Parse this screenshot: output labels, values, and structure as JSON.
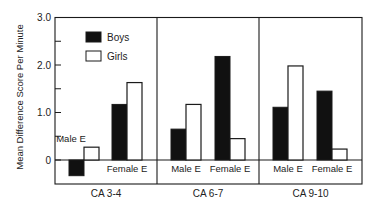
{
  "chart_data": {
    "type": "bar",
    "title": "",
    "xlabel": "",
    "ylabel": "Mean Difference Score Per Minute",
    "ylim": [
      -0.5,
      3.0
    ],
    "yticks": [
      {
        "value": 3.0,
        "label": "3.0"
      },
      {
        "value": 2.5,
        "label": ""
      },
      {
        "value": 2.0,
        "label": "2.0"
      },
      {
        "value": 1.5,
        "label": ""
      },
      {
        "value": 1.0,
        "label": "1.0"
      },
      {
        "value": 0.5,
        "label": ""
      },
      {
        "value": 0,
        "label": "0"
      }
    ],
    "grid": false,
    "legend": {
      "position": "upper-left (inside first panel)",
      "entries": [
        {
          "name": "Boys",
          "fill": "#111111"
        },
        {
          "name": "Girls",
          "fill": "#ffffff"
        }
      ]
    },
    "panels": [
      {
        "label": "CA 3-4",
        "groups": [
          {
            "label": "Male E",
            "label_position": "above",
            "boys": -0.33,
            "girls": 0.27
          },
          {
            "label": "Female E",
            "label_position": "below",
            "boys": 1.17,
            "girls": 1.63
          }
        ]
      },
      {
        "label": "CA 6-7",
        "groups": [
          {
            "label": "Male E",
            "label_position": "below",
            "boys": 0.65,
            "girls": 1.17
          },
          {
            "label": "Female E",
            "label_position": "below",
            "boys": 2.18,
            "girls": 0.45
          }
        ]
      },
      {
        "label": "CA 9-10",
        "groups": [
          {
            "label": "Male E",
            "label_position": "below",
            "boys": 1.11,
            "girls": 1.98
          },
          {
            "label": "Female E",
            "label_position": "below",
            "boys": 1.45,
            "girls": 0.23
          }
        ]
      }
    ],
    "categories": [
      "CA 3-4 Male E",
      "CA 3-4 Female E",
      "CA 6-7 Male E",
      "CA 6-7 Female E",
      "CA 9-10 Male E",
      "CA 9-10 Female E"
    ],
    "series": [
      {
        "name": "Boys",
        "values": [
          -0.33,
          1.17,
          0.65,
          2.18,
          1.11,
          1.45
        ]
      },
      {
        "name": "Girls",
        "values": [
          0.27,
          1.63,
          1.17,
          0.45,
          1.98,
          0.23
        ]
      }
    ]
  },
  "colors": {
    "boys": "#111111",
    "girls": "#ffffff",
    "axis": "#1a1a1a",
    "text": "#222222"
  }
}
